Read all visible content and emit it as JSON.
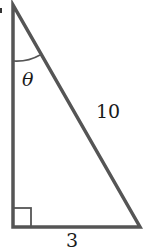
{
  "diagram": {
    "type": "right-triangle",
    "angle_label": "θ",
    "hypotenuse_label": "10",
    "base_label": "3",
    "right_angle_marker": true,
    "colors": {
      "stroke": "#555555",
      "text": "#1a1a1a",
      "background": "#ffffff"
    }
  }
}
